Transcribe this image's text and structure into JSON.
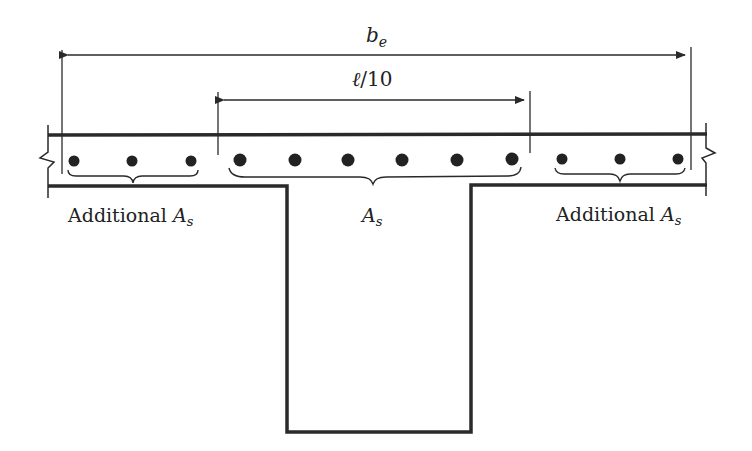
{
  "diagram": {
    "type": "T-beam cross-section, flange reinforcement distribution",
    "colors": {
      "line": "#2a2a2a",
      "bar": "#222222",
      "background": "#ffffff"
    },
    "dimensions": {
      "effective_width": {
        "symbol": "b",
        "subscript": "e",
        "label": "b_e"
      },
      "span_fraction": {
        "label": "ℓ/10",
        "symbol": "ℓ",
        "text": "/10"
      }
    },
    "labels": {
      "left_group": {
        "prefix": "Additional ",
        "symbol": "A",
        "subscript": "s"
      },
      "center_group": {
        "symbol": "A",
        "subscript": "s"
      },
      "right_group": {
        "prefix": "Additional ",
        "symbol": "A",
        "subscript": "s"
      }
    },
    "bars": {
      "left_additional_count": 3,
      "center_count": 6,
      "right_additional_count": 3
    }
  }
}
